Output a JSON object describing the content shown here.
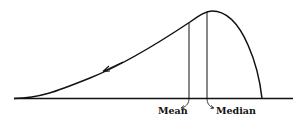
{
  "diagram": {
    "type": "negatively skewed distribution curve",
    "labels": {
      "mean": "Mean",
      "median": "Median"
    },
    "annotations": {
      "arrow": "left-pointing arrow indicating skew toward the left tail"
    },
    "colors": {
      "stroke": "#111111",
      "background": "#ffffff"
    }
  }
}
